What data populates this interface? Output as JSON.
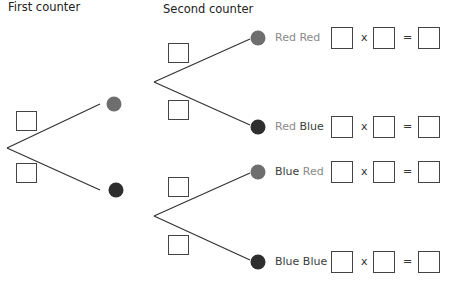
{
  "headers": {
    "first": "First counter",
    "second": "Second counter"
  },
  "colors": {
    "red_counter": "#6e6e6e",
    "blue_counter": "#2e2e2e",
    "red_text": "#8a8a8a",
    "blue_text": "#3c3c3c"
  },
  "operators": {
    "times": "x",
    "equals": "="
  },
  "outcomes": [
    {
      "first": "Red",
      "second": "Red"
    },
    {
      "first": "Red",
      "second": "Blue"
    },
    {
      "first": "Blue",
      "second": "Red"
    },
    {
      "first": "Blue",
      "second": "Blue"
    }
  ]
}
